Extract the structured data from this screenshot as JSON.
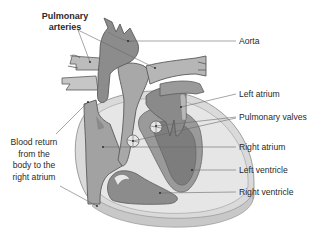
{
  "diagram": {
    "type": "anatomical-illustration",
    "colors": {
      "background": "#ffffff",
      "dark_tissue": "#7d7d7d",
      "mid_tissue": "#9a9a9a",
      "light_tissue": "#c4c4c4",
      "pale_tissue": "#dcdcdc",
      "outline": "#5a5a5a",
      "leader_line": "#6a6a6a",
      "text": "#2a2a2a"
    },
    "labels": {
      "pulmonary_arteries": {
        "line1": "Pulmonary",
        "line2": "arteries"
      },
      "aorta": "Aorta",
      "left_atrium": "Left atrium",
      "pulmonary_valves": "Pulmonary valves",
      "right_atrium": "Right atrium",
      "left_ventricle": "Left ventricle",
      "right_ventricle": "Right ventricle",
      "blood_return": {
        "line1": "Blood return",
        "line2": "from the",
        "line3": "body to the",
        "line4": "right atrium"
      }
    }
  }
}
